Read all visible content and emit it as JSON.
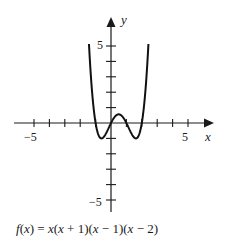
{
  "chart_data": {
    "type": "line",
    "title": "",
    "function": "f(x) = x(x + 1)(x − 1)(x − 2)",
    "xlabel": "x",
    "ylabel": "y",
    "xlim": [
      -6,
      6.5
    ],
    "ylim": [
      -5.5,
      6.5
    ],
    "x_ticks": [
      -5,
      -4,
      -3,
      -2,
      -1,
      1,
      2,
      3,
      4,
      5
    ],
    "x_tick_labels": {
      "-5": "−5",
      "5": "5"
    },
    "y_ticks": [
      -5,
      -4,
      -3,
      -2,
      -1,
      1,
      2,
      3,
      4,
      5
    ],
    "y_tick_labels": {
      "5": "5",
      "-5": "−5"
    },
    "grid": false,
    "legend": null,
    "series": [
      {
        "name": "f(x)",
        "x": [
          -1.43,
          -1.2,
          -1.0,
          -0.8,
          -0.62,
          -0.4,
          -0.2,
          0,
          0.2,
          0.4,
          0.5,
          0.6,
          0.8,
          1.0,
          1.2,
          1.4,
          1.62,
          1.8,
          2.0,
          2.2,
          2.43
        ],
        "values": [
          5.2,
          1.5,
          0,
          -0.7,
          -1.0,
          -0.7,
          -0.2,
          0,
          0.5,
          0.5,
          0.56,
          0.5,
          0.2,
          0,
          -0.5,
          -0.9,
          -1.0,
          -0.7,
          0,
          1.5,
          5.2
        ]
      }
    ],
    "zeros": [
      -1,
      0,
      1,
      2
    ]
  },
  "labels": {
    "x_axis": "x",
    "y_axis": "y",
    "x_neg5": "−5",
    "x_pos5": "5",
    "y_pos5": "5",
    "y_neg5": "−5"
  },
  "caption": {
    "fx": "f",
    "lp": "(",
    "x1": "x",
    "rest": ") = ",
    "x2": "x",
    "t1": "(",
    "x3": "x",
    "t2": " + 1)(",
    "x4": "x",
    "t3": " − 1)(",
    "x5": "x",
    "t4": " − 2)"
  }
}
